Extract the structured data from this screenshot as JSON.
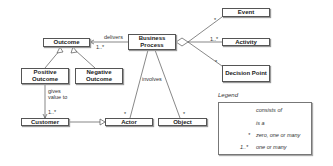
{
  "diagram": {
    "entities": {
      "outcome": "Outcome",
      "business_process": "Business Process",
      "positive_outcome": "Positive Outcome",
      "negative_outcome": "Negative Outcome",
      "customer": "Customer",
      "actor": "Actor",
      "object": "Object",
      "event": "Event",
      "activity": "Activity",
      "decision_point": "Decision Point"
    },
    "relations": {
      "delivers": "delivers",
      "delivers_mult": "1..*",
      "involves": "involves",
      "gives_value_to": "gives value to",
      "gives_value_mult": "1..*",
      "actor_mult": "*",
      "object_mult": "*",
      "event_mult": "*",
      "activity_mult": "1..*",
      "decision_mult": "*"
    }
  },
  "legend": {
    "title": "Legend",
    "items": [
      {
        "symbol": "diamond-line",
        "label": "consists of"
      },
      {
        "symbol": "hollow-triangle-line",
        "label": "is a"
      },
      {
        "symbol": "*",
        "label": "zero, one or many"
      },
      {
        "symbol": "1..*",
        "label": "one or many"
      }
    ]
  }
}
